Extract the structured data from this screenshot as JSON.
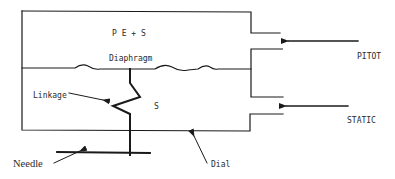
{
  "diagram": {
    "type": "pitot-static airspeed indicator schematic",
    "labels": {
      "upper_chamber": "P E + S",
      "diaphragm": "Diaphragm",
      "lower_chamber": "S",
      "linkage": "Linkage",
      "pitot": "PITOT",
      "static": "STATIC",
      "needle": "Needle",
      "dial": "Dial"
    },
    "colors": {
      "line": "#1a1a1a",
      "text": "#2a2a2a",
      "background": "#ffffff"
    }
  }
}
